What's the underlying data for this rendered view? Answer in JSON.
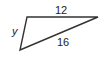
{
  "figure": {
    "type": "triangle",
    "stroke_color": "#333333",
    "vertices": [
      [
        27,
        17
      ],
      [
        98,
        17
      ],
      [
        20,
        50
      ]
    ],
    "labels": {
      "top_side": "12",
      "left_side": "y",
      "hypotenuse": "16"
    }
  }
}
